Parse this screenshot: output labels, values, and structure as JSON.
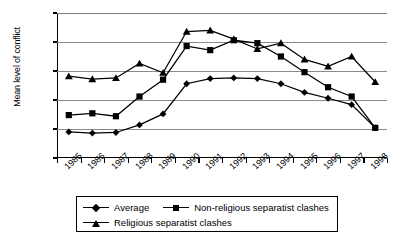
{
  "chart_data": {
    "type": "line",
    "title": "",
    "xlabel": "",
    "ylabel": "Mean level of conflict",
    "categories": [
      "1985",
      "1986",
      "1987",
      "1988",
      "1989",
      "1990",
      "1991",
      "1992",
      "1993",
      "1994",
      "1995",
      "1996",
      "1997",
      "1998"
    ],
    "ylim": [
      1.5,
      4
    ],
    "ytick_labels": [
      "4",
      "3.5",
      "3",
      "2.5",
      "2",
      "1.5"
    ],
    "ytick_values": [
      4,
      3.5,
      3,
      2.5,
      2,
      1.5
    ],
    "grid": true,
    "legend_position": "bottom",
    "series": [
      {
        "name": "Average",
        "marker": "diamond",
        "values": [
          1.95,
          1.93,
          1.94,
          2.07,
          2.26,
          2.78,
          2.87,
          2.88,
          2.87,
          2.78,
          2.63,
          2.53,
          2.42,
          2.02
        ]
      },
      {
        "name": "Non-religious separatist clashes",
        "marker": "square",
        "values": [
          2.24,
          2.27,
          2.22,
          2.56,
          2.85,
          3.43,
          3.36,
          3.53,
          3.48,
          3.25,
          2.98,
          2.72,
          2.56,
          2.02
        ]
      },
      {
        "name": "Religious separatist clashes",
        "marker": "triangle",
        "values": [
          2.91,
          2.86,
          2.88,
          3.13,
          2.97,
          3.68,
          3.7,
          3.55,
          3.38,
          3.48,
          3.2,
          3.08,
          3.25,
          2.81
        ]
      }
    ]
  },
  "colors": {
    "series": "#000000",
    "grid": "#8a8a8a",
    "axis": "#000000",
    "background": "#ffffff"
  }
}
